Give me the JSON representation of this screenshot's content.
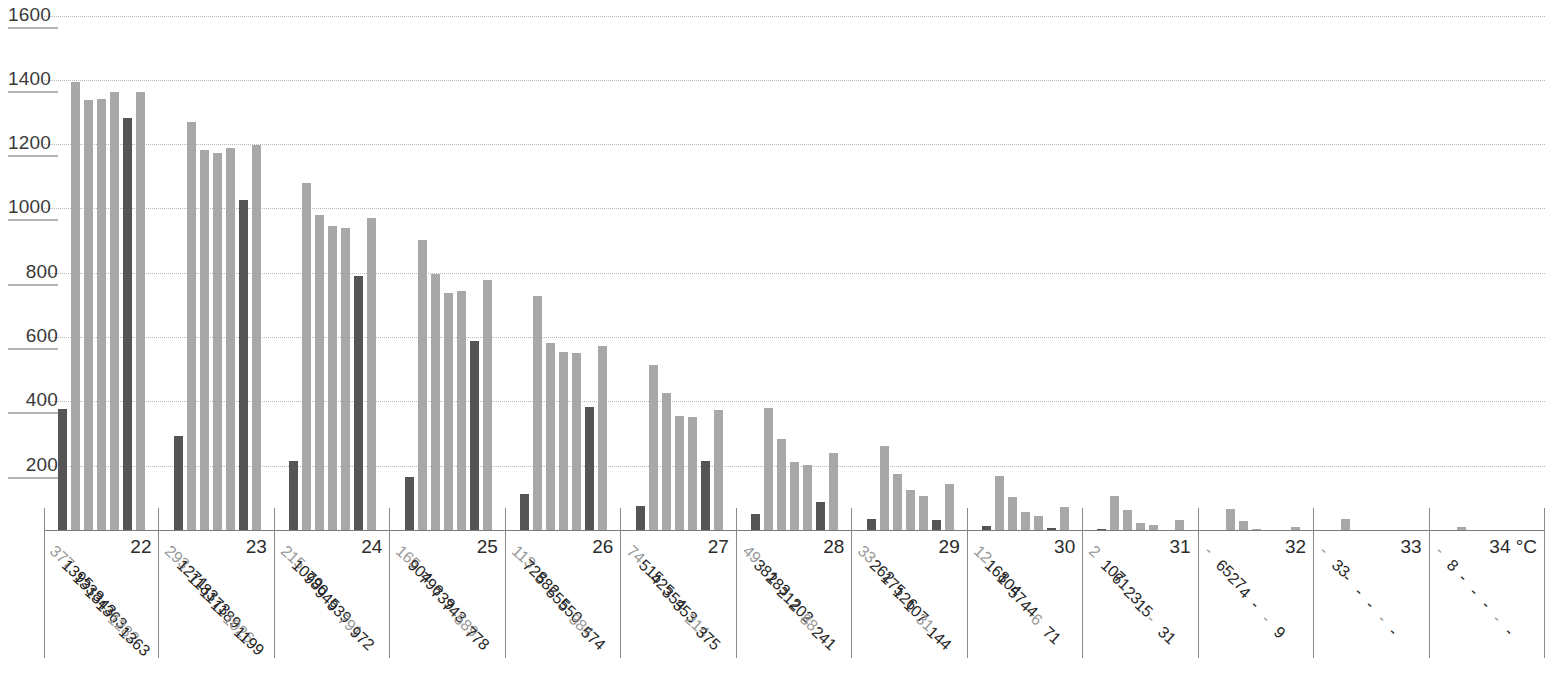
{
  "chart_data": {
    "type": "bar",
    "title": "",
    "xlabel": "",
    "ylabel": "",
    "ylim": [
      0,
      1600
    ],
    "grid": true,
    "legend": "none",
    "unit_label": "°C",
    "yticks": [
      1600,
      1400,
      1200,
      1000,
      800,
      600,
      400,
      200
    ],
    "categories": [
      "22",
      "23",
      "24",
      "25",
      "26",
      "27",
      "28",
      "29",
      "30",
      "31",
      "32",
      "33",
      "34 °C"
    ],
    "series_styles": [
      "dark",
      "light",
      "light",
      "light",
      "light",
      "dark",
      "light"
    ],
    "groups": [
      {
        "category": "22",
        "labels": [
          "377",
          "1395",
          "1338",
          "1343",
          "1363",
          "1282",
          "1363"
        ],
        "values": [
          377,
          1395,
          1338,
          1343,
          1363,
          1282,
          1363
        ]
      },
      {
        "category": "23",
        "labels": [
          "293",
          "1271",
          "1183",
          "1173",
          "1189",
          "1026",
          "1199"
        ],
        "values": [
          293,
          1271,
          1183,
          1173,
          1189,
          1026,
          1199
        ]
      },
      {
        "category": "24",
        "labels": [
          "215",
          "1079",
          "980",
          "945",
          "939",
          "791",
          "972"
        ],
        "values": [
          215,
          1079,
          980,
          945,
          939,
          791,
          972
        ]
      },
      {
        "category": "25",
        "labels": [
          "165",
          "904",
          "796",
          "739",
          "743",
          "589",
          "778"
        ],
        "values": [
          165,
          904,
          796,
          739,
          743,
          589,
          778
        ]
      },
      {
        "category": "26",
        "labels": [
          "113",
          "728",
          "582",
          "555",
          "550",
          "384",
          "574"
        ],
        "values": [
          113,
          728,
          582,
          555,
          550,
          384,
          574
        ]
      },
      {
        "category": "27",
        "labels": [
          "74",
          "515",
          "425",
          "354",
          "353",
          "214",
          "375"
        ],
        "values": [
          74,
          515,
          425,
          354,
          353,
          214,
          375
        ]
      },
      {
        "category": "28",
        "labels": [
          "49",
          "381",
          "283",
          "212",
          "202",
          "88",
          "241"
        ],
        "values": [
          49,
          381,
          283,
          212,
          202,
          88,
          241
        ]
      },
      {
        "category": "29",
        "labels": [
          "33",
          "262",
          "175",
          "126",
          "107",
          "31",
          "144"
        ],
        "values": [
          33,
          262,
          175,
          126,
          107,
          31,
          144
        ]
      },
      {
        "category": "30",
        "labels": [
          "12",
          "168",
          "104",
          "57",
          "44",
          "6",
          "71"
        ],
        "values": [
          12,
          168,
          104,
          57,
          44,
          6,
          71
        ]
      },
      {
        "category": "31",
        "labels": [
          "2",
          "107",
          "61",
          "23",
          "15",
          "-",
          "31"
        ],
        "values": [
          2,
          107,
          61,
          23,
          15,
          0,
          31
        ]
      },
      {
        "category": "32",
        "labels": [
          "-",
          "65",
          "27",
          "4",
          "-",
          "-",
          "9"
        ],
        "values": [
          0,
          65,
          27,
          4,
          0,
          0,
          9
        ]
      },
      {
        "category": "33",
        "labels": [
          "-",
          "33",
          "-",
          "-",
          "-",
          "-",
          "-"
        ],
        "values": [
          0,
          33,
          0,
          0,
          0,
          0,
          0
        ]
      },
      {
        "category": "34 °C",
        "labels": [
          "-",
          "8",
          "-",
          "-",
          "-",
          "-",
          "-"
        ],
        "values": [
          0,
          8,
          0,
          0,
          0,
          0,
          0
        ]
      }
    ]
  },
  "colors": {
    "bar_light": "#a8a8a8",
    "bar_dark": "#555555",
    "grid": "#b9b9b9",
    "axis": "#7a7a7a",
    "text": "#262626",
    "text_muted": "#9a9a9a"
  }
}
